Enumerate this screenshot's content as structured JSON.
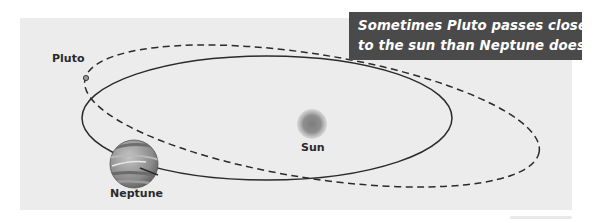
{
  "diagram": {
    "caption": {
      "line1": "Sometimes Pluto passes closer",
      "line2": "to the sun than Neptune does.",
      "background_color": "#4a4a4a",
      "text_color": "#ffffff"
    },
    "bodies": {
      "pluto": {
        "label": "Pluto",
        "orbit_style": "dashed"
      },
      "sun": {
        "label": "Sun"
      },
      "neptune": {
        "label": "Neptune",
        "orbit_style": "solid"
      }
    },
    "colors": {
      "panel_background": "#ececec",
      "orbit_line": "#2b2b2b",
      "sun": "#8a8a8a",
      "neptune": "#8c8c8c"
    }
  }
}
